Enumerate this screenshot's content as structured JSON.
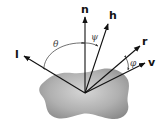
{
  "diagram": {
    "colors": {
      "vector": "#111111",
      "arc": "#333333",
      "surface_light": "#d8d8d8",
      "surface_dark": "#8e8e8e",
      "background": "#ffffff"
    },
    "vectors": [
      {
        "id": "n",
        "label": "n",
        "meaning": "surface normal"
      },
      {
        "id": "h",
        "label": "h",
        "meaning": "halfway vector"
      },
      {
        "id": "l",
        "label": "l",
        "meaning": "light direction"
      },
      {
        "id": "r",
        "label": "r",
        "meaning": "reflection direction"
      },
      {
        "id": "v",
        "label": "v",
        "meaning": "view direction"
      }
    ],
    "angles": [
      {
        "id": "theta",
        "label": "θ",
        "between": [
          "l",
          "n"
        ]
      },
      {
        "id": "psi",
        "label": "ψ",
        "between": [
          "n",
          "h"
        ]
      },
      {
        "id": "phi",
        "label": "φ",
        "between": [
          "r",
          "v"
        ]
      }
    ],
    "surface": {
      "label": "",
      "shape": "curved patch"
    }
  }
}
